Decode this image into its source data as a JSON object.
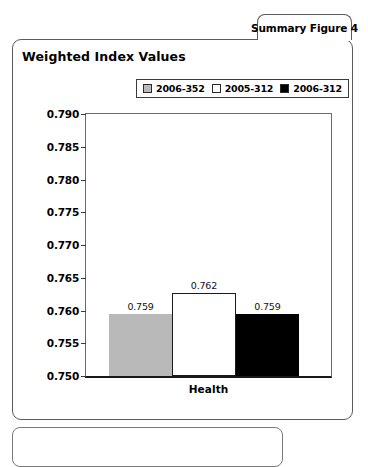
{
  "tab": {
    "label": "Summary Figure 4"
  },
  "panel": {
    "title": "Weighted Index Values"
  },
  "chart_data": {
    "type": "bar",
    "title": "Weighted Index Values",
    "xlabel": "",
    "ylabel": "",
    "categories": [
      "Health"
    ],
    "series": [
      {
        "name": "2006-352",
        "values": [
          0.759
        ],
        "color": "#b9b9b9"
      },
      {
        "name": "2005-312",
        "values": [
          0.762
        ],
        "color": "#ffffff"
      },
      {
        "name": "2006-312",
        "values": [
          0.759
        ],
        "color": "#000000"
      }
    ],
    "data_labels": [
      "0.759",
      "0.762",
      "0.759"
    ],
    "ylim": [
      0.75,
      0.79
    ],
    "ytick_labels": [
      "0.790",
      "0.785",
      "0.780",
      "0.775",
      "0.770",
      "0.765",
      "0.760",
      "0.755",
      "0.750"
    ],
    "ytick_values": [
      0.79,
      0.785,
      0.78,
      0.775,
      0.77,
      0.765,
      0.76,
      0.755,
      0.75
    ],
    "grid": false,
    "legend_position": "top-right",
    "bar_plot_values": [
      0.7595,
      0.7627,
      0.7594
    ]
  }
}
